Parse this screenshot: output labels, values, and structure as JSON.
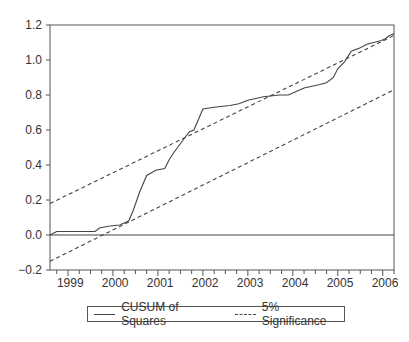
{
  "chart_data": {
    "type": "line",
    "title": "",
    "xlabel": "",
    "ylabel": "",
    "ylim": [
      -0.2,
      1.2
    ],
    "yticks": [
      -0.2,
      0.0,
      0.2,
      0.4,
      0.6,
      0.8,
      1.0,
      1.2
    ],
    "ytick_labels": [
      "-0.2",
      "0.0",
      "0.2",
      "0.4",
      "0.6",
      "0.8",
      "1.0",
      "1.2"
    ],
    "xtick_labels": [
      "1999",
      "2000",
      "2001",
      "2002",
      "2003",
      "2004",
      "2005",
      "2006"
    ],
    "xlim": [
      1998.6,
      2006.25
    ],
    "grid": false,
    "legend_position": "bottom",
    "series": [
      {
        "name": "CUSUM of Squares",
        "style": "solid",
        "x": [
          1998.6,
          1998.75,
          1999.6,
          1999.7,
          1999.9,
          2000.15,
          2000.35,
          2000.45,
          2000.6,
          2000.75,
          2000.95,
          2001.15,
          2001.25,
          2001.35,
          2001.55,
          2001.7,
          2001.8,
          2002.0,
          2002.25,
          2002.6,
          2002.8,
          2003.0,
          2003.35,
          2003.7,
          2003.9,
          2004.25,
          2004.6,
          2004.75,
          2004.9,
          2005.0,
          2005.15,
          2005.3,
          2005.5,
          2005.65,
          2005.95,
          2006.05,
          2006.15,
          2006.25
        ],
        "values": [
          0.0,
          0.02,
          0.02,
          0.04,
          0.05,
          0.057,
          0.08,
          0.14,
          0.25,
          0.34,
          0.37,
          0.38,
          0.43,
          0.47,
          0.54,
          0.59,
          0.6,
          0.72,
          0.73,
          0.74,
          0.75,
          0.77,
          0.79,
          0.8,
          0.8,
          0.84,
          0.86,
          0.87,
          0.9,
          0.95,
          0.99,
          1.05,
          1.07,
          1.09,
          1.11,
          1.12,
          1.14,
          1.15
        ]
      },
      {
        "name": "5% Significance (upper)",
        "style": "dashed",
        "x": [
          1998.6,
          2006.25
        ],
        "values": [
          0.18,
          1.14
        ]
      },
      {
        "name": "5% Significance (lower)",
        "style": "dashed",
        "x": [
          1998.6,
          2006.25
        ],
        "values": [
          -0.15,
          0.83
        ]
      }
    ],
    "reference_lines": [
      {
        "y": 0.0,
        "style": "solid"
      }
    ],
    "legend": [
      "CUSUM of Squares",
      "5% Significance"
    ]
  },
  "legend": {
    "cusum_label": "CUSUM of Squares",
    "significance_label": "5% Significance"
  },
  "colors": {
    "line": "#444444",
    "axis": "#555555",
    "text": "#333333"
  }
}
